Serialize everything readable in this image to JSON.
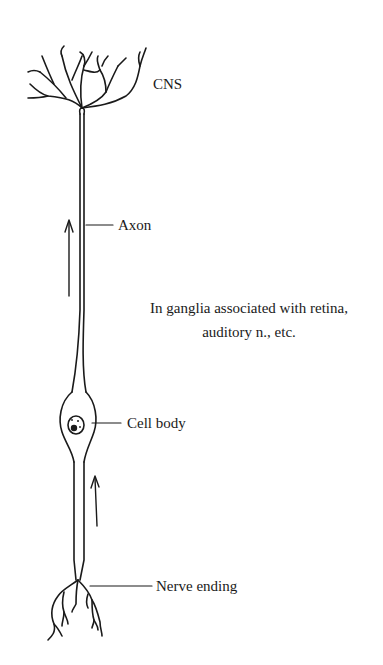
{
  "diagram": {
    "type": "neuron-illustration",
    "labels": {
      "cns": "CNS",
      "axon": "Axon",
      "cell_body": "Cell body",
      "nerve_ending": "Nerve ending"
    },
    "note": {
      "line1": "In ganglia associated with retina,",
      "line2": "auditory n., etc."
    },
    "arrows": [
      {
        "name": "upper-arrow",
        "direction": "up"
      },
      {
        "name": "lower-arrow",
        "direction": "up"
      }
    ],
    "colors": {
      "ink": "#1a1a1a",
      "background": "#ffffff"
    }
  }
}
